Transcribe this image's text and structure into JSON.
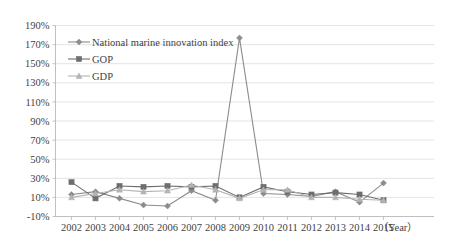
{
  "chart_data": {
    "type": "line",
    "title": "",
    "xlabel": "（Year）",
    "ylabel": "",
    "categories": [
      "2002",
      "2003",
      "2004",
      "2005",
      "2006",
      "2007",
      "2008",
      "2009",
      "2010",
      "2011",
      "2012",
      "2013",
      "2014",
      "2015"
    ],
    "ylim": [
      -10,
      190
    ],
    "ytick_labels": [
      "190%",
      "170%",
      "150%",
      "130%",
      "110%",
      "90%",
      "70%",
      "50%",
      "30%",
      "10%",
      "-10%"
    ],
    "ytick_values": [
      190,
      170,
      150,
      130,
      110,
      90,
      70,
      50,
      30,
      10,
      -10
    ],
    "ytick_step": 20,
    "grid": true,
    "legend_position": "top-left",
    "series": [
      {
        "name": "National marine innovation index",
        "marker": "diamond",
        "color": "#8c8c8c",
        "values": [
          13,
          16,
          9,
          2,
          1,
          17,
          7,
          177,
          14,
          13,
          11,
          16,
          5,
          25
        ]
      },
      {
        "name": "GOP",
        "marker": "square",
        "color": "#6e6e6e",
        "values": [
          26,
          9,
          22,
          21,
          22,
          21,
          22,
          10,
          21,
          16,
          13,
          15,
          13,
          7
        ]
      },
      {
        "name": "GDP",
        "marker": "triangle",
        "color": "#b3b3b3",
        "values": [
          10,
          14,
          18,
          16,
          17,
          23,
          18,
          9,
          18,
          18,
          10,
          10,
          8,
          7
        ]
      }
    ]
  },
  "legend": {
    "items": [
      {
        "label": "National marine innovation index"
      },
      {
        "label": "GOP"
      },
      {
        "label": "GDP"
      }
    ]
  },
  "axes": {
    "x_axis_title": "（Year）"
  },
  "colors": {
    "series1": "#8c8c8c",
    "series2": "#6e6e6e",
    "series3": "#b3b3b3",
    "grid": "#d9d9d9",
    "axis": "#b0b0b0",
    "text": "#3f3f3f",
    "background": "#ffffff"
  }
}
